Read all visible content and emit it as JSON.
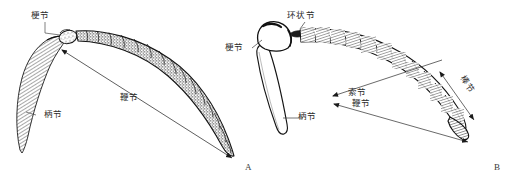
{
  "figure": {
    "background_color": "#ffffff",
    "ink_color": "#1a1a1a",
    "label_color": "#2b2b2b",
    "panels": [
      {
        "id": "A",
        "caption": "A",
        "description": "丝状触角，示柄节、梗节与鞭节",
        "labels": [
          {
            "name": "pedicel",
            "text": "梗节"
          },
          {
            "name": "scape",
            "text": "柄节"
          },
          {
            "name": "flagellum",
            "text": "鞭节"
          }
        ]
      },
      {
        "id": "B",
        "caption": "B",
        "description": "膝状触角，示柄节、梗节、环状节、索节、鞭节与棒节",
        "labels": [
          {
            "name": "annulus",
            "text": "环状节"
          },
          {
            "name": "pedicel",
            "text": "梗节"
          },
          {
            "name": "scape",
            "text": "柄节"
          },
          {
            "name": "funicle",
            "text": "索节"
          },
          {
            "name": "flagellum",
            "text": "鞭节"
          },
          {
            "name": "club",
            "text": "棒节"
          }
        ]
      }
    ]
  },
  "labels": {
    "a_pedicel": "梗节",
    "a_scape": "柄节",
    "a_flagellum": "鞭节",
    "b_annulus": "环状节",
    "b_pedicel": "梗节",
    "b_scape": "柄节",
    "b_funicle": "索节",
    "b_flagellum": "鞭节",
    "b_club": "棒节"
  },
  "captions": {
    "panel_a": "A",
    "panel_b": "B"
  },
  "top_strip": {
    "visible_fragments": [
      "",
      "",
      "",
      "",
      "",
      ""
    ]
  }
}
